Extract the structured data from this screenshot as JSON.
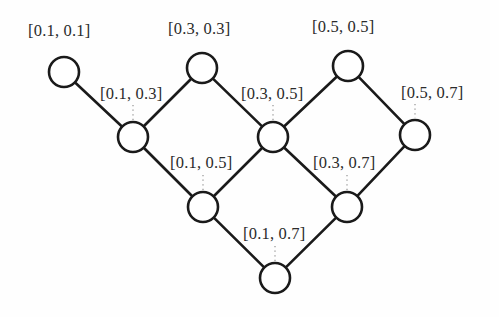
{
  "figure": {
    "background_color": "#fefefe",
    "stroke_color": "#1a1a1a",
    "label_color": "#2b2b2b",
    "node_fill": "#ffffff",
    "node_radius": 15,
    "edge_width": 2.6
  },
  "nodes": [
    {
      "id": "n1",
      "label": "[0.1, 0.1]",
      "cx": 64,
      "cy": 72,
      "label_x": 28,
      "label_y": 21
    },
    {
      "id": "n2",
      "label": "[0.3, 0.3]",
      "cx": 202,
      "cy": 68,
      "label_x": 168,
      "label_y": 19
    },
    {
      "id": "n3",
      "label": "[0.5, 0.5]",
      "cx": 348,
      "cy": 66,
      "label_x": 312,
      "label_y": 17
    },
    {
      "id": "n4",
      "label": "[0.1, 0.3]",
      "cx": 133,
      "cy": 137,
      "label_x": 100,
      "label_y": 84
    },
    {
      "id": "n5",
      "label": "[0.3, 0.5]",
      "cx": 273,
      "cy": 137,
      "label_x": 241,
      "label_y": 84
    },
    {
      "id": "n6",
      "label": "[0.5, 0.7]",
      "cx": 415,
      "cy": 135,
      "label_x": 401,
      "label_y": 83
    },
    {
      "id": "n7",
      "label": "[0.1, 0.5]",
      "cx": 203,
      "cy": 207,
      "label_x": 170,
      "label_y": 153
    },
    {
      "id": "n8",
      "label": "[0.3, 0.7]",
      "cx": 347,
      "cy": 207,
      "label_x": 313,
      "label_y": 153
    },
    {
      "id": "n9",
      "label": "[0.1, 0.7]",
      "cx": 275,
      "cy": 278,
      "label_x": 243,
      "label_y": 224
    }
  ],
  "edges": [
    {
      "from": "n1",
      "to": "n4"
    },
    {
      "from": "n2",
      "to": "n4"
    },
    {
      "from": "n2",
      "to": "n5"
    },
    {
      "from": "n3",
      "to": "n5"
    },
    {
      "from": "n3",
      "to": "n6"
    },
    {
      "from": "n4",
      "to": "n7"
    },
    {
      "from": "n5",
      "to": "n7"
    },
    {
      "from": "n5",
      "to": "n8"
    },
    {
      "from": "n6",
      "to": "n8"
    },
    {
      "from": "n7",
      "to": "n9"
    },
    {
      "from": "n8",
      "to": "n9"
    }
  ],
  "leaders": [
    {
      "node": "n4",
      "x": 133,
      "y_top": 105,
      "y_bottom": 120
    },
    {
      "node": "n5",
      "x": 273,
      "y_top": 105,
      "y_bottom": 120
    },
    {
      "node": "n6",
      "x": 415,
      "y_top": 104,
      "y_bottom": 118
    },
    {
      "node": "n7",
      "x": 203,
      "y_top": 175,
      "y_bottom": 190
    },
    {
      "node": "n8",
      "x": 347,
      "y_top": 175,
      "y_bottom": 190
    },
    {
      "node": "n9",
      "x": 275,
      "y_top": 246,
      "y_bottom": 261
    }
  ]
}
